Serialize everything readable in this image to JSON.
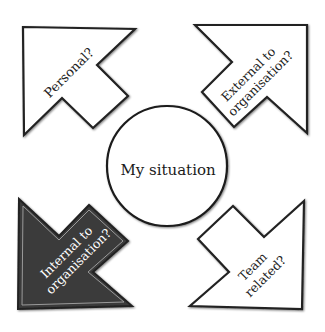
{
  "diagram": {
    "center": {
      "label": "My situation"
    },
    "arrows": [
      {
        "id": "top-left",
        "lines": [
          "Personal?"
        ],
        "fill": "#ffffff",
        "text_color": "#222222"
      },
      {
        "id": "top-right",
        "lines": [
          "External to",
          "organisation?"
        ],
        "fill": "#ffffff",
        "text_color": "#222222"
      },
      {
        "id": "bottom-left",
        "lines": [
          "Internal to",
          "organisation?"
        ],
        "fill": "#3a3a3a",
        "text_color": "#ffffff"
      },
      {
        "id": "bottom-right",
        "lines": [
          "Team",
          "related?"
        ],
        "fill": "#ffffff",
        "text_color": "#222222"
      }
    ]
  }
}
